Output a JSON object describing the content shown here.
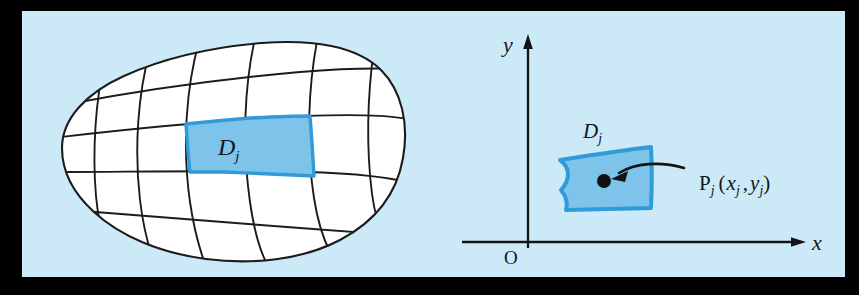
{
  "figure": {
    "panel": {
      "background_color": "#cbe9f7",
      "page_background_color": "#ffffff",
      "x": 22,
      "y": 11,
      "width": 823,
      "height": 266
    },
    "colors": {
      "background": "#cbe9f7",
      "curve_stroke": "#1c1c1c",
      "region_fill": "#7ec3ea",
      "region_stroke": "#2f9bd8",
      "blob_fill": "#ffffff",
      "text": "#14161a",
      "axis": "#141414",
      "point_fill": "#111111"
    },
    "left_panel": {
      "name": "partitioned-region-blob",
      "description": "Closed egg-shaped plane region subdivided by a curvilinear grid; one cell highlighted in blue",
      "highlighted_cell_label": "D",
      "highlighted_cell_subscript": "j",
      "vertical_grid_curve_count": 6,
      "horizontal_grid_curve_count": 4
    },
    "right_panel": {
      "name": "coordinate-plane-subregion",
      "description": "Single curvilinear quadrilateral subregion in the first quadrant of an xy-plane with labeled sample point",
      "axes": {
        "x_label": "x",
        "y_label": "y",
        "origin_label": "O"
      },
      "region_label": "D",
      "region_subscript": "j",
      "point": {
        "name": "P",
        "name_subscript": "j",
        "coordinates_open": "(",
        "coord_x": "x",
        "coord_x_subscript": "j",
        "coord_separator": ",",
        "coord_y": "y",
        "coord_y_subscript": "j",
        "coordinates_close": ")",
        "full_label": "P_j (x_j , y_j)"
      }
    }
  }
}
